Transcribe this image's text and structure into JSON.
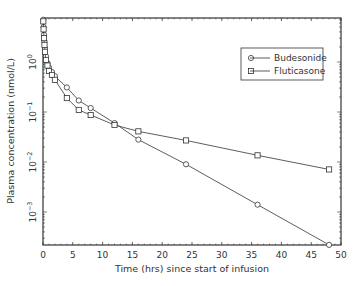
{
  "chart_data": {
    "type": "line",
    "title": "",
    "xlabel": "Time (hrs) since start of infusion",
    "ylabel": "Plasma concentration (nmol/L)",
    "xlim": [
      0,
      50
    ],
    "ylim": [
      0.00022,
      7.6
    ],
    "yscale": "log",
    "x_ticks": [
      0,
      5,
      10,
      15,
      20,
      25,
      30,
      35,
      40,
      45,
      50
    ],
    "y_ticks": [
      {
        "value": 1,
        "label": "10^0"
      },
      {
        "value": 0.1,
        "label": "10^-1"
      },
      {
        "value": 0.01,
        "label": "10^-2"
      },
      {
        "value": 0.001,
        "label": "10^-3"
      }
    ],
    "grid": false,
    "legend_position": "upper right",
    "series": [
      {
        "name": "Budesonide",
        "marker": "circle",
        "x": [
          0.05,
          0.1,
          0.17,
          0.25,
          0.33,
          0.5,
          0.75,
          1,
          1.5,
          2,
          4,
          6,
          8,
          12,
          16,
          24,
          36,
          48
        ],
        "y": [
          7.0,
          5.0,
          3.5,
          2.6,
          1.9,
          1.3,
          0.95,
          0.78,
          0.63,
          0.52,
          0.31,
          0.17,
          0.12,
          0.06,
          0.028,
          0.009,
          0.0014,
          0.00022
        ]
      },
      {
        "name": "Fluticasone",
        "marker": "square",
        "x": [
          0.05,
          0.1,
          0.17,
          0.25,
          0.33,
          0.5,
          0.75,
          1,
          1.5,
          2,
          4,
          6,
          8,
          12,
          16,
          24,
          36,
          48
        ],
        "y": [
          6.5,
          4.5,
          3.0,
          2.2,
          1.6,
          1.1,
          0.85,
          0.66,
          0.55,
          0.44,
          0.19,
          0.11,
          0.087,
          0.055,
          0.041,
          0.027,
          0.0136,
          0.0071
        ]
      }
    ]
  },
  "labels": {
    "xlabel": "Time (hrs) since start of infusion",
    "ylabel": "Plasma concentration (nmol/L)",
    "legend": [
      "Budesonide",
      "Fluticasone"
    ]
  }
}
